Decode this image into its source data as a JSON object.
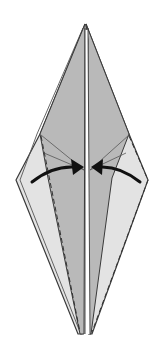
{
  "diagram": {
    "type": "origami-fold-step",
    "colors": {
      "background": "#ffffff",
      "front_layer": "#b9b9b9",
      "back_layer": "#e3e3e3",
      "outline": "#3a3a3a",
      "arrow": "#111111",
      "crease_dashed": "#333333"
    },
    "arrows": [
      {
        "name": "left-fold-arrow",
        "direction": "toward-center"
      },
      {
        "name": "right-fold-arrow",
        "direction": "toward-center"
      }
    ],
    "lines": {
      "valley_folds": 2,
      "center_slit": 1
    }
  }
}
